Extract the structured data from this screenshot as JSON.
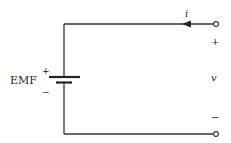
{
  "diagram": {
    "type": "circuit",
    "source": {
      "label": "EMF",
      "plus_sign": "+",
      "minus_sign": "−"
    },
    "current": {
      "label": "i",
      "direction": "leftward into top terminal"
    },
    "terminals": {
      "voltage_label": "v",
      "plus_sign": "+",
      "minus_sign": "−"
    },
    "colors": {
      "wire": "#333333",
      "text": "#222222",
      "background": "#ffffff"
    }
  }
}
